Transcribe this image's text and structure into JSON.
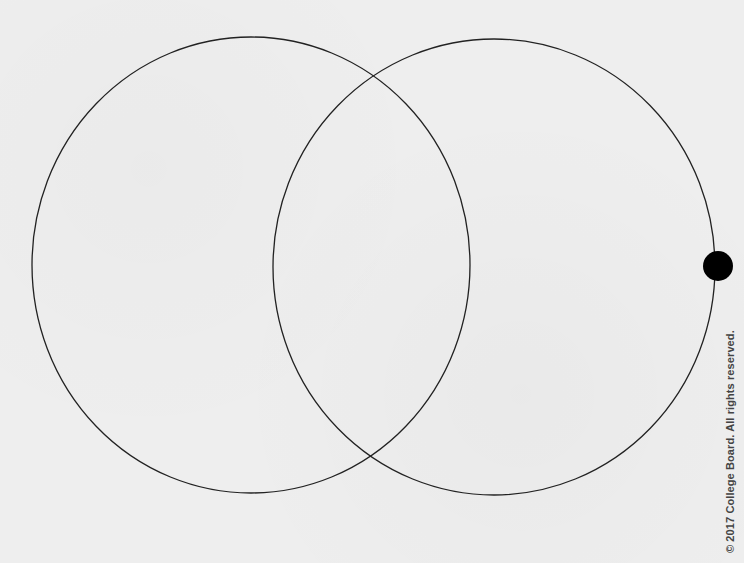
{
  "diagram": {
    "type": "venn",
    "background": "#eeeeee",
    "stroke_color": "#222222",
    "circles": [
      {
        "name": "left-circle",
        "cx": 251,
        "cy": 265,
        "rx": 219,
        "ry": 228
      },
      {
        "name": "right-circle",
        "cx": 494,
        "cy": 267,
        "rx": 221,
        "ry": 228
      }
    ],
    "marker": {
      "name": "point-marker",
      "cx": 718,
      "cy": 266,
      "r": 15,
      "color": "#000000"
    }
  },
  "footer": {
    "copyright": "© 2017 College Board. All rights reserved."
  }
}
